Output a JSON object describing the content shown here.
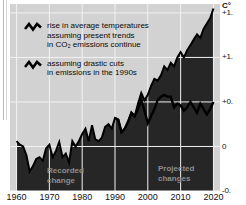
{
  "chart_data": {
    "type": "area",
    "title": "",
    "xlabel": "",
    "ylabel": "C°",
    "unit_label": "C°",
    "xlim": [
      1958,
      2022
    ],
    "ylim": [
      -0.5,
      1.6
    ],
    "grid": true,
    "legend_position": "top-left",
    "x_ticks": [
      "1960",
      "1970",
      "1980",
      "1990",
      "2000",
      "2010",
      "2020"
    ],
    "x_tick_values": [
      1960,
      1970,
      1980,
      1990,
      2000,
      2010,
      2020
    ],
    "y_ticks": [
      "+1.",
      "+1.",
      "+0.",
      "0",
      "-0."
    ],
    "y_tick_values": [
      1.5,
      1.0,
      0.5,
      0.0,
      -0.5
    ],
    "y_ticks_full": [
      "+1.5",
      "+1.0",
      "+0.5",
      "0",
      "-0.5"
    ],
    "annotations": [
      {
        "id": "recorded",
        "lines": [
          "Recorded",
          "change"
        ]
      },
      {
        "id": "projected",
        "lines": [
          "Projected",
          "changes"
        ]
      }
    ],
    "series": [
      {
        "name": "rise in average temperatures assuming present trends in CO2 emissions continue",
        "legend_lines": [
          "rise in average temperatures",
          "assuming present trends",
          "in CO",
          "2",
          " emissions continue"
        ],
        "color": "#000000",
        "filled": true,
        "x": [
          1960,
          1961,
          1962,
          1963,
          1964,
          1965,
          1966,
          1967,
          1968,
          1969,
          1970,
          1971,
          1972,
          1973,
          1974,
          1975,
          1976,
          1977,
          1978,
          1979,
          1980,
          1981,
          1982,
          1983,
          1984,
          1985,
          1986,
          1987,
          1988,
          1989,
          1990,
          1991,
          1992,
          1993,
          1994,
          1995,
          1996,
          1997,
          1998,
          1999,
          2000,
          2001,
          2002,
          2003,
          2004,
          2005,
          2006,
          2007,
          2008,
          2009,
          2010,
          2011,
          2012,
          2013,
          2014,
          2015,
          2016,
          2017,
          2018,
          2019,
          2020
        ],
        "values": [
          0.06,
          0.02,
          0.0,
          -0.1,
          -0.28,
          -0.22,
          -0.14,
          -0.12,
          -0.16,
          -0.02,
          0.02,
          -0.12,
          -0.05,
          0.05,
          -0.12,
          -0.08,
          -0.18,
          0.06,
          0.0,
          0.06,
          0.14,
          0.2,
          0.06,
          0.24,
          0.08,
          0.06,
          0.1,
          0.22,
          0.25,
          0.2,
          0.32,
          0.3,
          0.16,
          0.2,
          0.28,
          0.38,
          0.34,
          0.48,
          0.6,
          0.52,
          0.58,
          0.68,
          0.76,
          0.74,
          0.8,
          0.9,
          0.86,
          0.94,
          0.9,
          1.0,
          1.06,
          1.0,
          1.08,
          1.14,
          1.2,
          1.26,
          1.22,
          1.32,
          1.38,
          1.44,
          1.55
        ]
      },
      {
        "name": "assuming drastic cuts in emissions in the 1990s",
        "legend_lines": [
          "assuming drastic cuts",
          "in emissions in the 1990s"
        ],
        "color": "#000000",
        "filled": false,
        "x": [
          1990,
          1991,
          1992,
          1993,
          1994,
          1995,
          1996,
          1997,
          1998,
          1999,
          2000,
          2001,
          2002,
          2003,
          2004,
          2005,
          2006,
          2007,
          2008,
          2009,
          2010,
          2011,
          2012,
          2013,
          2014,
          2015,
          2016,
          2017,
          2018,
          2019,
          2020
        ],
        "values": [
          0.32,
          0.3,
          0.16,
          0.2,
          0.28,
          0.38,
          0.34,
          0.42,
          0.52,
          0.4,
          0.26,
          0.34,
          0.42,
          0.52,
          0.56,
          0.58,
          0.56,
          0.56,
          0.44,
          0.48,
          0.46,
          0.4,
          0.44,
          0.5,
          0.44,
          0.38,
          0.48,
          0.42,
          0.36,
          0.42,
          0.5
        ]
      }
    ]
  },
  "legend": {
    "items": [
      {
        "glyph": "zigzag-line",
        "lines": [
          "rise in average temperatures",
          "assuming present trends",
          "in CO₂ emissions continue"
        ]
      },
      {
        "glyph": "zigzag-line",
        "lines": [
          "assuming drastic cuts",
          "in emissions in the 1990s"
        ]
      }
    ]
  }
}
